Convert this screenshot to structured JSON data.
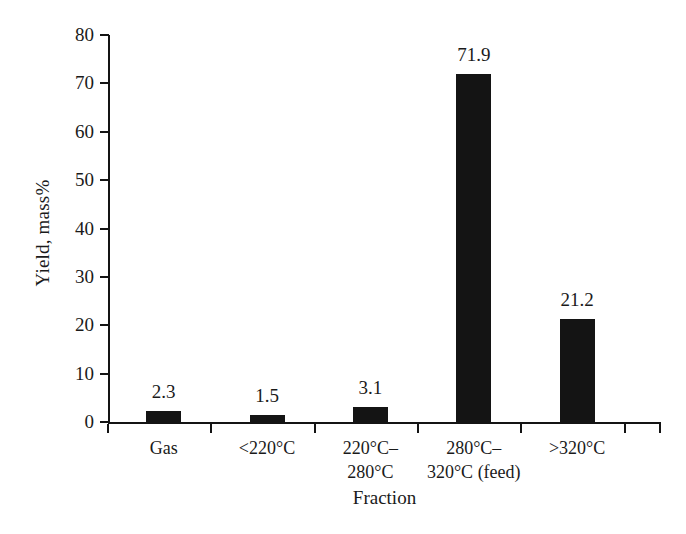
{
  "chart_data": {
    "type": "bar",
    "title": "",
    "xlabel": "Fraction",
    "ylabel": "Yield, mass%",
    "categories": [
      "Gas",
      "<220°C",
      "220°C–\n280°C",
      "280°C–\n320°C (feed)",
      ">320°C"
    ],
    "category_lines": [
      [
        "Gas"
      ],
      [
        "<220°C"
      ],
      [
        "220°C–",
        "280°C"
      ],
      [
        "280°C–",
        "320°C (feed)"
      ],
      [
        ">320°C"
      ]
    ],
    "values": [
      2.3,
      1.5,
      3.1,
      71.9,
      21.2
    ],
    "value_labels": [
      "2.3",
      "1.5",
      "3.1",
      "71.9",
      "21.2"
    ],
    "ylim": [
      0,
      80
    ],
    "yticks": [
      0,
      10,
      20,
      30,
      40,
      50,
      60,
      70,
      80
    ],
    "ytick_labels": [
      "0",
      "10",
      "20",
      "30",
      "40",
      "50",
      "60",
      "70",
      "80"
    ],
    "grid": false,
    "legend": false,
    "bar_color": "#141414",
    "axis_color": "#141414",
    "background_color": "#ffffff"
  }
}
